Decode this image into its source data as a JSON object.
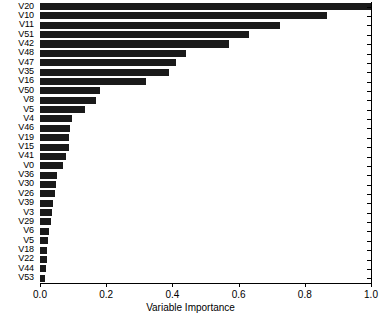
{
  "chart_data": {
    "type": "bar",
    "orientation": "horizontal",
    "title": "",
    "xlabel": "Variable Importance",
    "ylabel": "",
    "xlim": [
      0.0,
      1.0
    ],
    "xticks": [
      "0.0",
      "0.2",
      "0.4",
      "0.6",
      "0.8",
      "1.0"
    ],
    "xtick_values": [
      0.0,
      0.2,
      0.4,
      0.6,
      0.8,
      1.0
    ],
    "grid": false,
    "legend": null,
    "bar_color": "#1a1a1a",
    "background_color": "#ffffff",
    "axis_color": "#000000",
    "categories": [
      "V20",
      "V10",
      "V11",
      "V51",
      "V42",
      "V48",
      "V47",
      "V35",
      "V16",
      "V50",
      "V8",
      "V5",
      "V4",
      "V46",
      "V19",
      "V15",
      "V41",
      "V0",
      "V36",
      "V30",
      "V26",
      "V39",
      "V3",
      "V29",
      "V6",
      "V5",
      "V18",
      "V22",
      "V44",
      "V53"
    ],
    "values": [
      1.0,
      0.866,
      0.725,
      0.632,
      0.571,
      0.441,
      0.411,
      0.39,
      0.32,
      0.181,
      0.169,
      0.136,
      0.097,
      0.091,
      0.088,
      0.088,
      0.079,
      0.07,
      0.052,
      0.048,
      0.045,
      0.039,
      0.036,
      0.033,
      0.027,
      0.024,
      0.021,
      0.021,
      0.018,
      0.015
    ]
  }
}
